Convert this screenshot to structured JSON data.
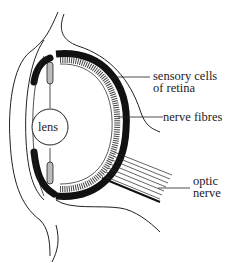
{
  "diagram": {
    "caption_partial": "(cut off)",
    "labels": {
      "sensory_cells_line1": "sensory cells",
      "sensory_cells_line2": "of retina",
      "nerve_fibres": "nerve fibres",
      "optic_line1": "optic",
      "optic_line2": "nerve",
      "lens": "lens"
    },
    "colors": {
      "ink": "#111111",
      "background": "#ffffff"
    }
  }
}
